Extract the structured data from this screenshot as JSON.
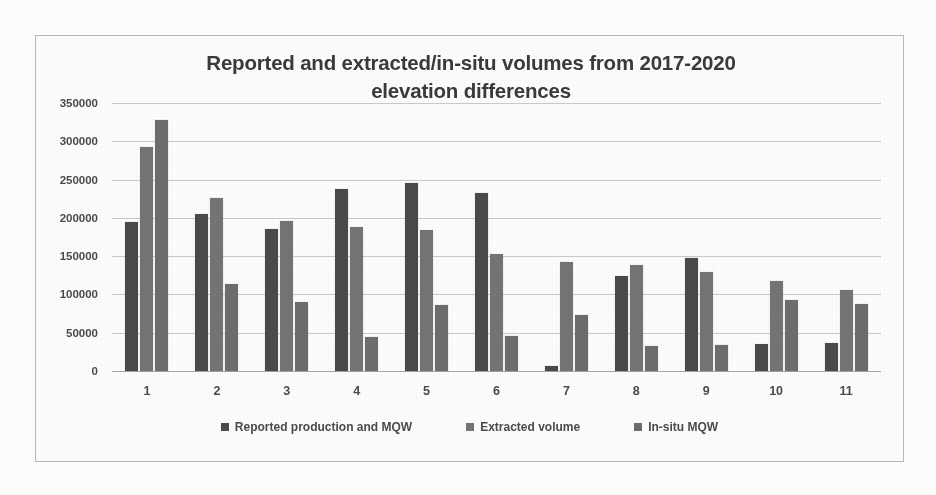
{
  "chart_data": {
    "type": "bar",
    "title": "Reported and extracted/in-situ volumes  from 2017-2020 elevation differences",
    "title_line1": "Reported and extracted/in-situ volumes  from 2017-2020",
    "title_line2": "elevation differences",
    "xlabel": "",
    "ylabel": "",
    "grid": true,
    "legend_position": "bottom",
    "ylim": [
      0,
      350000
    ],
    "ytick_labels": [
      "350000",
      "300000",
      "250000",
      "200000",
      "150000",
      "100000",
      "50000",
      "0"
    ],
    "yticks": [
      350000,
      300000,
      250000,
      200000,
      150000,
      100000,
      50000,
      0
    ],
    "categories": [
      "1",
      "2",
      "3",
      "4",
      "5",
      "6",
      "7",
      "8",
      "9",
      "10",
      "11"
    ],
    "series": [
      {
        "name": "Reported production and MQW",
        "color": "#4a4a4a",
        "values": [
          195000,
          205000,
          185000,
          238000,
          246000,
          232000,
          6000,
          124000,
          147000,
          35000,
          37000
        ]
      },
      {
        "name": "Extracted volume",
        "color": "#747474",
        "values": [
          293000,
          226000,
          196000,
          188000,
          184000,
          153000,
          143000,
          138000,
          129000,
          117000,
          106000
        ]
      },
      {
        "name": "In-situ MQW",
        "color": "#6d6d6d",
        "values": [
          328000,
          113000,
          90000,
          44000,
          86000,
          46000,
          73000,
          33000,
          34000,
          93000,
          88000
        ]
      }
    ]
  }
}
